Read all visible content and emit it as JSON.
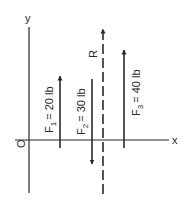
{
  "diagram": {
    "axes": {
      "x_label": "x",
      "y_label": "y",
      "origin_label": "O"
    },
    "forces": [
      {
        "id": "F1",
        "name": "F",
        "subscript": "1",
        "value_text": "= 20 lb",
        "direction": "up"
      },
      {
        "id": "F2",
        "name": "F",
        "subscript": "2",
        "value_text": "= 30 lb",
        "direction": "down"
      },
      {
        "id": "F3",
        "name": "F",
        "subscript": "3",
        "value_text": "= 40 lb",
        "direction": "up"
      }
    ],
    "resultant": {
      "label": "R",
      "direction": "up",
      "style": "dashed"
    },
    "colors": {
      "ink": "#2a2a2a",
      "background": "#ffffff"
    }
  }
}
